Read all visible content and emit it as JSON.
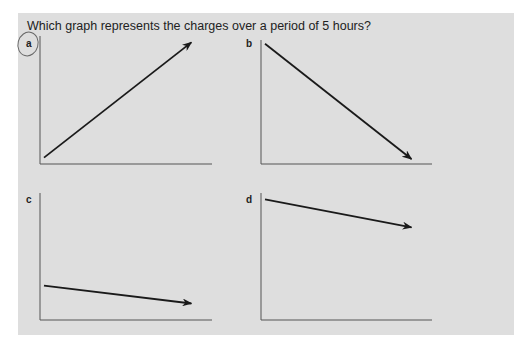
{
  "question": "Which graph represents the charges over a period of 5 hours?",
  "selected_option": "a",
  "options": [
    {
      "id": "a",
      "label": "a",
      "trend": "increasing",
      "start_level": 0.05,
      "end_level": 0.95
    },
    {
      "id": "b",
      "label": "b",
      "trend": "decreasing",
      "start_level": 0.97,
      "end_level": 0.04
    },
    {
      "id": "c",
      "label": "c",
      "trend": "slightly decreasing",
      "start_level": 0.27,
      "end_level": 0.13
    },
    {
      "id": "d",
      "label": "d",
      "trend": "slightly decreasing",
      "start_level": 0.95,
      "end_level": 0.73
    }
  ],
  "colors": {
    "panel": "#dedede",
    "ink": "#1a1a1a",
    "axis": "#555555",
    "circle": "#666666"
  }
}
